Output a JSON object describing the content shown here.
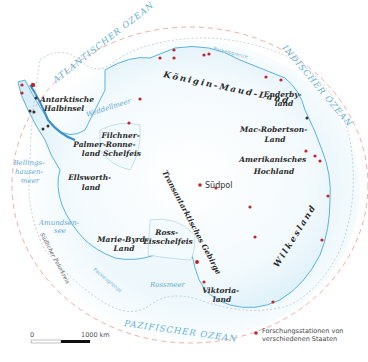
{
  "map": {
    "title": "Antarktis",
    "oceans": {
      "atlantic": "ATLANTISCHER OZEAN",
      "indian": "INDISCHER OZEAN",
      "pacific": "PAZIFISCHER OZEAN"
    },
    "seas": {
      "weddell": "Weddellmeer",
      "bellingshausen": [
        "Bellings-",
        "hausen-",
        "meer"
      ],
      "amundsen": [
        "Amundsen-",
        "see"
      ],
      "ross": "Rossmeer"
    },
    "regions": {
      "peninsula": [
        "Antarktische",
        "Halbinsel"
      ],
      "queen_maud": "Königin-Maud-Land",
      "enderby": [
        "Enderby-",
        "land"
      ],
      "mac_robertson": [
        "Mac-Robertson-",
        "Land"
      ],
      "american_highland": [
        "Amerikanisches",
        "Hochland"
      ],
      "filchner": [
        "Filchner-",
        "Ronne-",
        "Schelfeis"
      ],
      "palmer": [
        "Palmer-",
        "land"
      ],
      "ellsworth": [
        "Ellsworth-",
        "land"
      ],
      "transantarctic": "Transantarktisches Gebirge",
      "marie_byrd": [
        "Marie-Byrd-",
        "Land"
      ],
      "ross_ice_shelf": [
        "Ross-",
        "Eisschelfeis"
      ],
      "victoria": [
        "Viktoria-",
        "land"
      ],
      "wilkes": "Wilkesland"
    },
    "south_pole": "Südpol",
    "pack_ice_label": "Packeisgrenze",
    "polar_circle_label": "Südlicher Polarkreis",
    "scale": {
      "start": "0",
      "end": "1000 km"
    },
    "legend": {
      "stations_line1": "Forschungsstationen von",
      "stations_line2": "verschiedenen Staaten"
    },
    "colors": {
      "ice": "#eaf6fb",
      "coast": "#4aa7d6",
      "station": "#c0282d",
      "polar_circle": "#e89a8a",
      "pack_ice": "#9fb8c8"
    }
  }
}
